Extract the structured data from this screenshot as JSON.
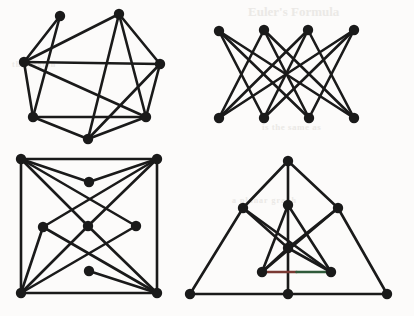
{
  "figure": {
    "background_color": "#fcfbfa",
    "ink_color": "#1a1a1a",
    "vertex_radius": 5.2,
    "edge_width": 2.6,
    "ghost_text": [
      {
        "text": "Euler's Formula",
        "class": "ghost-1"
      },
      {
        "text": "is the same as",
        "class": "ghost-2"
      },
      {
        "text": "the region",
        "class": "ghost-3"
      },
      {
        "text": "a planar graph",
        "class": "ghost-4"
      }
    ],
    "graphs": [
      {
        "name": "graph-top-left",
        "label": "7-vertex heptagonal graph with crossing chords",
        "vertex_count": 7,
        "edge_count": 14,
        "vertices": [
          {
            "id": "a",
            "x": 60,
            "y": 16
          },
          {
            "id": "b",
            "x": 119,
            "y": 14
          },
          {
            "id": "c",
            "x": 160,
            "y": 64
          },
          {
            "id": "d",
            "x": 146,
            "y": 117
          },
          {
            "id": "e",
            "x": 88,
            "y": 139
          },
          {
            "id": "f",
            "x": 33,
            "y": 117
          },
          {
            "id": "g",
            "x": 24,
            "y": 62
          }
        ],
        "edges": [
          [
            "a",
            "g"
          ],
          [
            "a",
            "f"
          ],
          [
            "b",
            "g"
          ],
          [
            "b",
            "c"
          ],
          [
            "b",
            "d"
          ],
          [
            "b",
            "e"
          ],
          [
            "c",
            "d"
          ],
          [
            "c",
            "g"
          ],
          [
            "c",
            "e"
          ],
          [
            "d",
            "e"
          ],
          [
            "d",
            "f"
          ],
          [
            "d",
            "g"
          ],
          [
            "e",
            "f"
          ],
          [
            "f",
            "g"
          ]
        ]
      },
      {
        "name": "graph-top-right",
        "label": "Bipartite graph K4,4 minus a perfect matching",
        "vertex_count": 8,
        "edge_count": 12,
        "vertices": [
          {
            "id": "t1",
            "x": 219,
            "y": 31
          },
          {
            "id": "t2",
            "x": 264,
            "y": 30
          },
          {
            "id": "t3",
            "x": 308,
            "y": 30
          },
          {
            "id": "t4",
            "x": 354,
            "y": 30
          },
          {
            "id": "b1",
            "x": 219,
            "y": 118
          },
          {
            "id": "b2",
            "x": 264,
            "y": 118
          },
          {
            "id": "b3",
            "x": 309,
            "y": 118
          },
          {
            "id": "b4",
            "x": 354,
            "y": 118
          }
        ],
        "edges": [
          [
            "t1",
            "b2"
          ],
          [
            "t1",
            "b3"
          ],
          [
            "t1",
            "b4"
          ],
          [
            "t2",
            "b1"
          ],
          [
            "t2",
            "b3"
          ],
          [
            "t2",
            "b4"
          ],
          [
            "t3",
            "b1"
          ],
          [
            "t3",
            "b2"
          ],
          [
            "t3",
            "b4"
          ],
          [
            "t4",
            "b1"
          ],
          [
            "t4",
            "b2"
          ],
          [
            "t4",
            "b3"
          ]
        ]
      },
      {
        "name": "graph-bottom-left",
        "label": "Square with inscribed diamond lattice",
        "vertex_count": 9,
        "edge_count": 16,
        "vertices": [
          {
            "id": "nw",
            "x": 21,
            "y": 159
          },
          {
            "id": "ne",
            "x": 157,
            "y": 159
          },
          {
            "id": "sw",
            "x": 21,
            "y": 293
          },
          {
            "id": "se",
            "x": 157,
            "y": 293
          },
          {
            "id": "dt",
            "x": 89,
            "y": 182
          },
          {
            "id": "dl",
            "x": 43,
            "y": 227
          },
          {
            "id": "dc",
            "x": 88,
            "y": 226
          },
          {
            "id": "dr",
            "x": 136,
            "y": 226
          },
          {
            "id": "db",
            "x": 89,
            "y": 271
          }
        ],
        "edges": [
          [
            "nw",
            "ne"
          ],
          [
            "nw",
            "sw"
          ],
          [
            "ne",
            "se"
          ],
          [
            "sw",
            "se"
          ],
          [
            "nw",
            "dt"
          ],
          [
            "nw",
            "dc"
          ],
          [
            "nw",
            "dr"
          ],
          [
            "ne",
            "dt"
          ],
          [
            "ne",
            "dc"
          ],
          [
            "ne",
            "dl"
          ],
          [
            "sw",
            "dl"
          ],
          [
            "sw",
            "dc"
          ],
          [
            "sw",
            "dr"
          ],
          [
            "se",
            "db"
          ],
          [
            "se",
            "dl"
          ],
          [
            "se",
            "dc"
          ]
        ]
      },
      {
        "name": "graph-bottom-right",
        "label": "Nested triangle graph with central hub",
        "vertex_count": 10,
        "edge_count": 18,
        "vertices": [
          {
            "id": "apex",
            "x": 288,
            "y": 161
          },
          {
            "id": "oml",
            "x": 243,
            "y": 208
          },
          {
            "id": "omr",
            "x": 338,
            "y": 208
          },
          {
            "id": "obl",
            "x": 190,
            "y": 294
          },
          {
            "id": "obm",
            "x": 288,
            "y": 294
          },
          {
            "id": "obr",
            "x": 387,
            "y": 294
          },
          {
            "id": "iapex",
            "x": 288,
            "y": 205
          },
          {
            "id": "ic",
            "x": 288,
            "y": 248
          },
          {
            "id": "ibl",
            "x": 262,
            "y": 272
          },
          {
            "id": "ibr",
            "x": 331,
            "y": 272
          }
        ],
        "edges": [
          [
            "apex",
            "oml"
          ],
          [
            "apex",
            "omr"
          ],
          [
            "oml",
            "obl"
          ],
          [
            "omr",
            "obr"
          ],
          [
            "obl",
            "obm"
          ],
          [
            "obm",
            "obr"
          ],
          [
            "iapex",
            "ic"
          ],
          [
            "ic",
            "obm"
          ],
          [
            "iapex",
            "ibl"
          ],
          [
            "iapex",
            "ibr"
          ],
          [
            "ibl",
            "ibr"
          ],
          [
            "ibl",
            "ic"
          ],
          [
            "ibr",
            "ic"
          ],
          [
            "oml",
            "ic"
          ],
          [
            "omr",
            "ic"
          ],
          [
            "oml",
            "ibr"
          ],
          [
            "omr",
            "ibl"
          ],
          [
            "apex",
            "iapex"
          ]
        ],
        "tinted_edge": {
          "pair": [
            "ibl",
            "ibr"
          ],
          "colors": [
            "#7a3a34",
            "#2f5a3a"
          ]
        }
      }
    ]
  }
}
